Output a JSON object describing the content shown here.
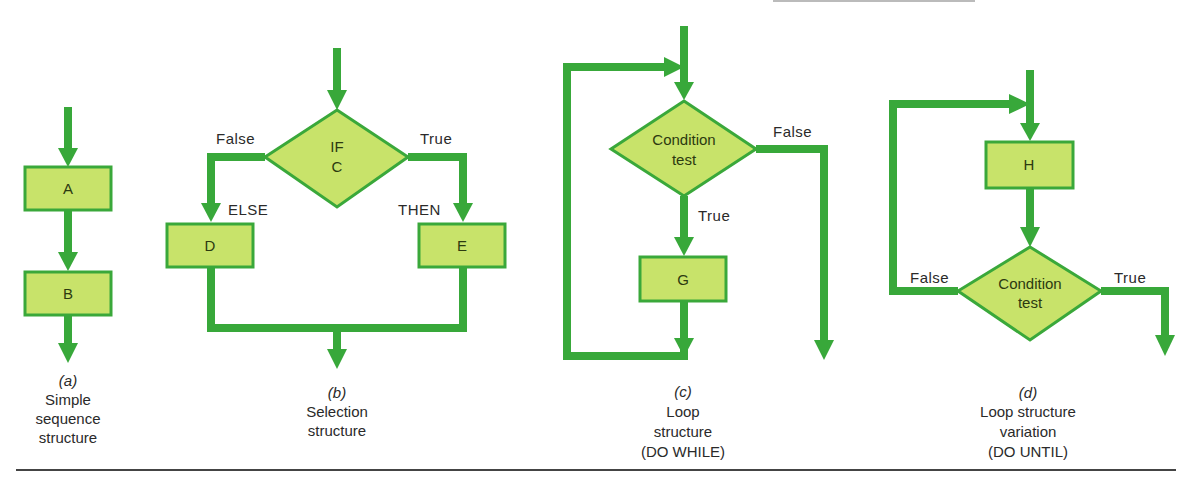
{
  "colors": {
    "flow": "#38a83a",
    "node_fill": "#c8e36a",
    "node_stroke": "#3aa83a",
    "text": "#2a2a2a"
  },
  "diagrams": [
    {
      "id": "a",
      "nodes": [
        {
          "type": "process",
          "label": "A"
        },
        {
          "type": "process",
          "label": "B"
        }
      ],
      "caption": {
        "letter": "(a)",
        "lines": [
          "Simple",
          "sequence",
          "structure"
        ]
      }
    },
    {
      "id": "b",
      "decision": {
        "line1": "IF",
        "line2": "C"
      },
      "branch_labels": {
        "false": "False",
        "true": "True",
        "else": "ELSE",
        "then": "THEN"
      },
      "nodes": [
        {
          "type": "process",
          "label": "D"
        },
        {
          "type": "process",
          "label": "E"
        }
      ],
      "caption": {
        "letter": "(b)",
        "lines": [
          "Selection",
          "structure"
        ]
      }
    },
    {
      "id": "c",
      "decision": {
        "line1": "Condition",
        "line2": "test"
      },
      "branch_labels": {
        "false": "False",
        "true": "True"
      },
      "nodes": [
        {
          "type": "process",
          "label": "G"
        }
      ],
      "caption": {
        "letter": "(c)",
        "lines": [
          "Loop",
          "structure",
          "(DO WHILE)"
        ]
      }
    },
    {
      "id": "d",
      "decision": {
        "line1": "Condition",
        "line2": "test"
      },
      "branch_labels": {
        "false": "False",
        "true": "True"
      },
      "nodes": [
        {
          "type": "process",
          "label": "H"
        }
      ],
      "caption": {
        "letter": "(d)",
        "lines": [
          "Loop structure",
          "variation",
          "(DO UNTIL)"
        ]
      }
    }
  ]
}
